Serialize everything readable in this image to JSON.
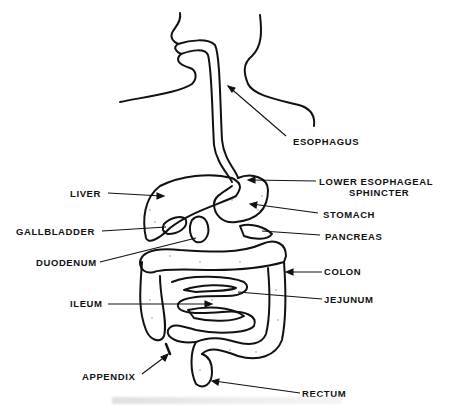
{
  "diagram": {
    "labels": {
      "esophagus": "ESOPHAGUS",
      "lower_esophageal_sphincter_line1": "LOWER   ESOPHAGEAL",
      "lower_esophageal_sphincter_line2": "SPHINCTER",
      "stomach": "STOMACH",
      "pancreas": "PANCREAS",
      "colon": "COLON",
      "jejunum": "JEJUNUM",
      "rectum": "RECTUM",
      "liver": "LIVER",
      "gallbladder": "GALLBLADDER",
      "duodenum": "DUODENUM",
      "ileum": "ILEUM",
      "appendix": "APPENDIX"
    },
    "colors": {
      "ink": "#111111",
      "background": "#ffffff"
    }
  }
}
